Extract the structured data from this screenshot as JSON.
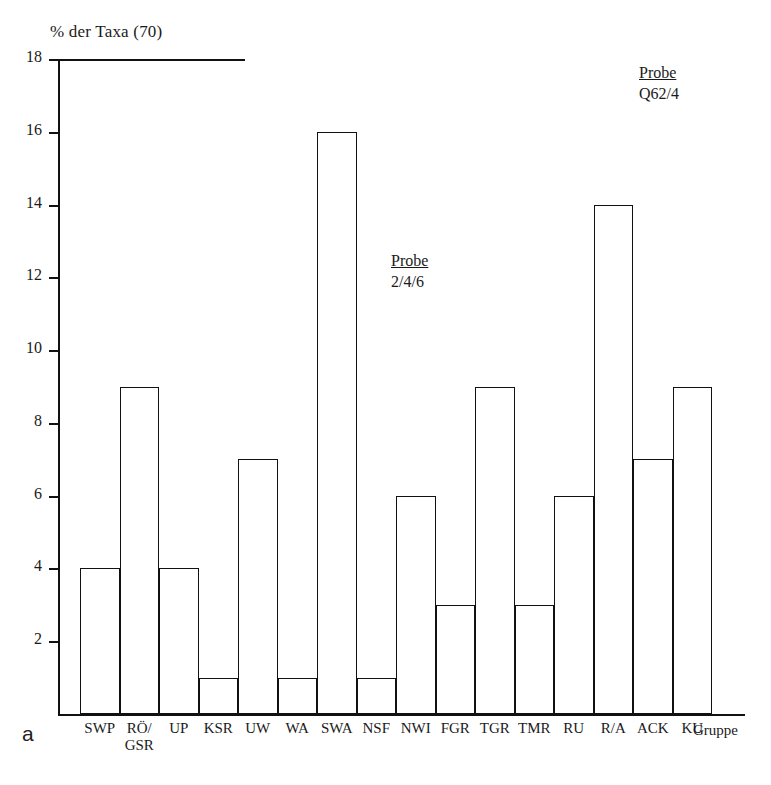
{
  "figure": {
    "panel_letter": "a"
  },
  "chart_data": {
    "type": "bar",
    "title": "",
    "ylabel": "% der Taxa (70)",
    "xlabel": "Gruppe",
    "ylim": [
      0,
      18
    ],
    "yticks": [
      0,
      2,
      4,
      6,
      8,
      10,
      12,
      14,
      16,
      18
    ],
    "ytick_labels": [
      "2",
      "4",
      "6",
      "8",
      "10",
      "12",
      "14",
      "16",
      "18"
    ],
    "grid": false,
    "legend": null,
    "categories": [
      "SWP",
      "RÖ/\nGSR",
      "UP",
      "KSR",
      "UW",
      "WA",
      "SWA",
      "NSF",
      "NWI",
      "FGR",
      "TGR",
      "TMR",
      "RU",
      "R/A",
      "ACK",
      "KU"
    ],
    "values": [
      4,
      9,
      4,
      1,
      7,
      1,
      16,
      1,
      6,
      3,
      9,
      3,
      6,
      14,
      7,
      9
    ],
    "annotations": [
      {
        "id": "q62",
        "header": "Probe",
        "sub": "Q62/4"
      },
      {
        "id": "246",
        "header": "Probe",
        "sub": "2/4/6"
      }
    ]
  }
}
